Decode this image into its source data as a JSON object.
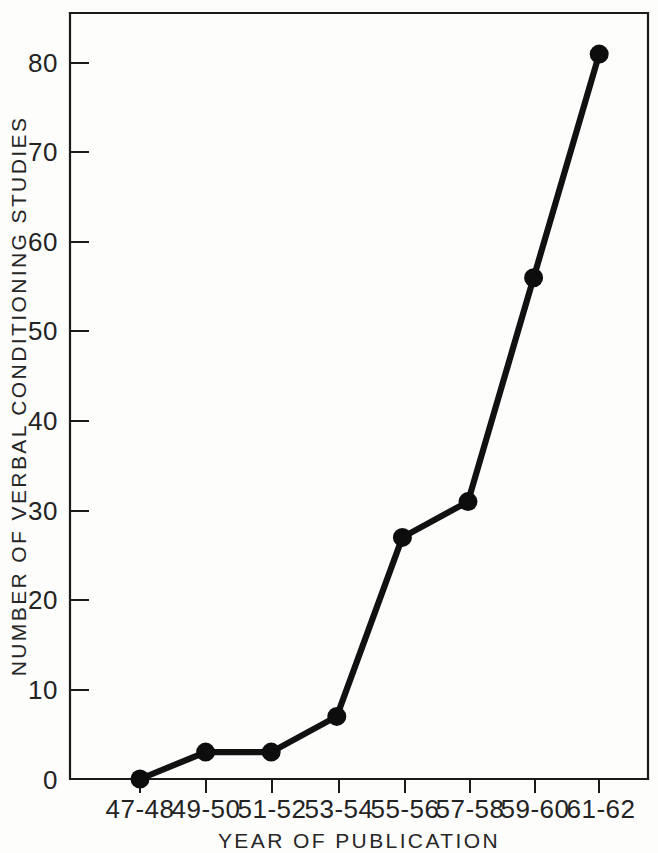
{
  "chart_data": {
    "type": "line",
    "title": "",
    "xlabel": "YEAR OF PUBLICATION",
    "ylabel": "NUMBER OF VERBAL CONDITIONING STUDIES",
    "categories": [
      "47-48",
      "49-50",
      "51-52",
      "53-54",
      "55-56",
      "57-58",
      "59-60",
      "61-62"
    ],
    "values": [
      0,
      3,
      3,
      7,
      27,
      31,
      56,
      81
    ],
    "series": [
      {
        "name": "Number of verbal conditioning studies",
        "values": [
          0,
          3,
          3,
          7,
          27,
          31,
          56,
          81
        ]
      }
    ],
    "ylim": [
      0,
      85
    ],
    "ytick_labels": [
      "0",
      "10",
      "20",
      "30",
      "40",
      "50",
      "60",
      "70",
      "80"
    ],
    "ytick_values": [
      0,
      10,
      20,
      30,
      40,
      50,
      60,
      70,
      80
    ],
    "xtick_labels": [
      "47-48",
      "49-50",
      "51-52",
      "53-54",
      "55-56",
      "57-58",
      "59-60",
      "61-62"
    ],
    "grid": false,
    "legend": false,
    "legend_position": "none",
    "marker": "filled-circle",
    "line_color": "#111111",
    "marker_color": "#0d0d0d",
    "axis_color": "#1a1a1a",
    "background_color": "#fdfdfc"
  }
}
